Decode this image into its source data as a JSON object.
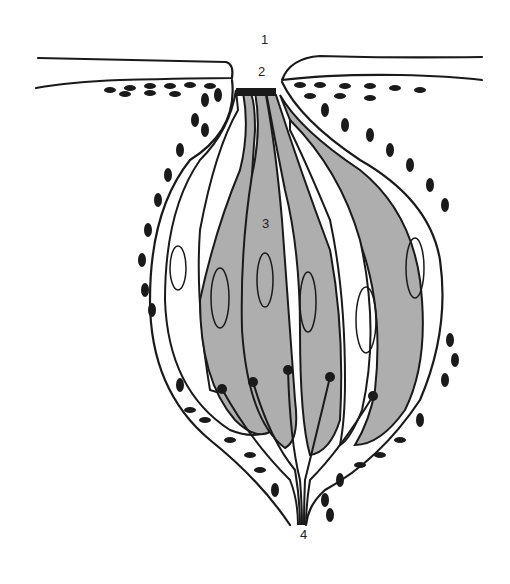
{
  "diagram": {
    "colors": {
      "cell_fill": "#aeaeae",
      "outline": "#1a1a1a",
      "background": "#ffffff"
    },
    "labels": [
      {
        "id": "1",
        "text": "1",
        "x": 261,
        "y": 40
      },
      {
        "id": "2",
        "text": "2",
        "x": 258,
        "y": 70
      },
      {
        "id": "3",
        "text": "3",
        "x": 262,
        "y": 222
      },
      {
        "id": "4",
        "text": "4",
        "x": 300,
        "y": 533
      }
    ]
  }
}
